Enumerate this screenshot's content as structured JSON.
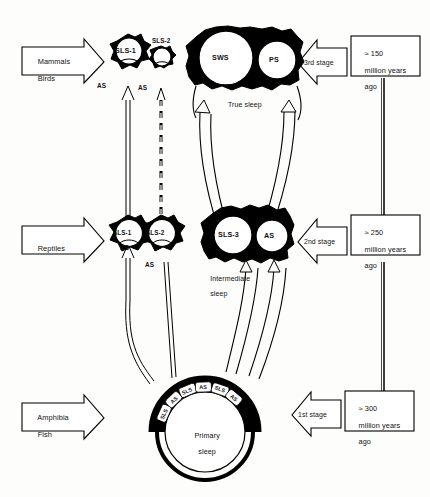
{
  "figure": {
    "ink_color": "#000000",
    "paper_color": "#fdfdfb"
  },
  "taxa_arrows": [
    {
      "id": "mammals-birds",
      "line1": "Mammals",
      "line2": "Birds"
    },
    {
      "id": "reptiles",
      "line1": "Reptiles",
      "line2": ""
    },
    {
      "id": "amphibia-fish",
      "line1": "Amphibia",
      "line2": "Fish"
    }
  ],
  "stage_arrows": [
    {
      "id": "stage-3",
      "label": "3rd stage"
    },
    {
      "id": "stage-2",
      "label": "2nd stage"
    },
    {
      "id": "stage-1",
      "label": "1st stage"
    }
  ],
  "era_boxes": [
    {
      "id": "era-150",
      "line1": "≈ 150",
      "line2": "million years",
      "line3": "ago"
    },
    {
      "id": "era-250",
      "line1": "≈ 250",
      "line2": "million years",
      "line3": "ago"
    },
    {
      "id": "era-300",
      "line1": "≈ 300",
      "line2": "million years",
      "line3": "ago"
    }
  ],
  "top_row": {
    "sls1": {
      "label": "SLS-1",
      "as": "AS"
    },
    "sls2": {
      "label": "SLS-2",
      "as": "AS"
    },
    "sws": {
      "label": "SWS"
    },
    "ps": {
      "label": "PS"
    },
    "caption": "True sleep"
  },
  "middle_row": {
    "sls1": {
      "label": "SLS-1",
      "as": "AS"
    },
    "sls2": {
      "label": "SLS-2",
      "as": "AS"
    },
    "sls3": {
      "label": "SLS-3"
    },
    "as": {
      "label": "AS"
    },
    "caption_line1": "Intermediate",
    "caption_line2": "sleep"
  },
  "bottom_row": {
    "center_line1": "Primary",
    "center_line2": "sleep",
    "ring_sequence": [
      "SLS",
      "AS",
      "SLS",
      "AS",
      "SLS",
      "AS"
    ]
  }
}
